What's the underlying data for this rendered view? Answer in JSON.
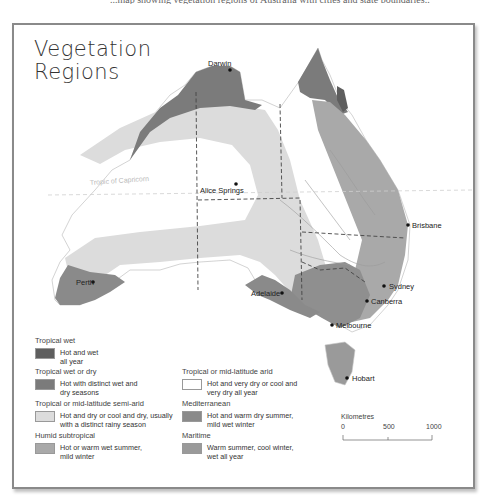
{
  "caption_clipped": "...map showing vegetation regions of Australia with cities and state boundaries...",
  "map": {
    "title_line1": "Vegetation",
    "title_line2": "Regions",
    "tropic_label": "Tropic of Capricorn",
    "cities": [
      {
        "name": "Darwin"
      },
      {
        "name": "Alice Springs"
      },
      {
        "name": "Brisbane"
      },
      {
        "name": "Perth"
      },
      {
        "name": "Adelaide"
      },
      {
        "name": "Sydney"
      },
      {
        "name": "Canberra"
      },
      {
        "name": "Melbourne"
      },
      {
        "name": "Hobart"
      }
    ],
    "colors": {
      "tropical_wet": "#5e5e5e",
      "tropical_wet_dry": "#7b7b7b",
      "semi_arid": "#dcdcdc",
      "humid_subtropical": "#a9a9a9",
      "arid": "#ffffff",
      "mediterranean": "#8a8a8a",
      "maritime": "#9a9a9a",
      "outline": "#c8c8c8"
    }
  },
  "legend": {
    "items": [
      {
        "title": "Tropical wet",
        "desc1": "Hot and wet",
        "desc2": "all year",
        "color": "#5e5e5e"
      },
      {
        "title": "Tropical wet or dry",
        "desc1": "Hot with distinct wet and",
        "desc2": "dry seasons",
        "color": "#7b7b7b"
      },
      {
        "title": "Tropical or mid-latitude semi-arid",
        "desc1": "Hot and dry or cool and dry, usually",
        "desc2": "with a distinct rainy season",
        "color": "#dcdcdc"
      },
      {
        "title": "Humid subtropical",
        "desc1": "Hot or warm wet summer,",
        "desc2": "mild winter",
        "color": "#a9a9a9"
      },
      {
        "title": "Tropical or mid-latitude arid",
        "desc1": "Hot and very dry or cool and",
        "desc2": "very dry all year",
        "color": "#ffffff"
      },
      {
        "title": "Mediterranean",
        "desc1": "Hot and warm dry summer,",
        "desc2": "mild wet winter",
        "color": "#8a8a8a"
      },
      {
        "title": "Maritime",
        "desc1": "Warm summer, cool winter,",
        "desc2": "wet all year",
        "color": "#9a9a9a"
      }
    ]
  },
  "scale": {
    "title": "Kilometres",
    "ticks": [
      "0",
      "500",
      "1000"
    ]
  }
}
